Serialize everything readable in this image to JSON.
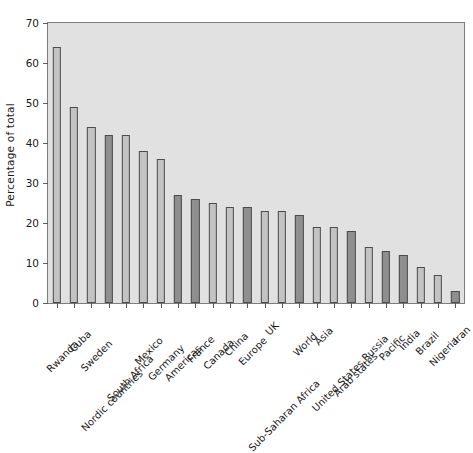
{
  "chart_data": {
    "type": "bar",
    "title": "",
    "xlabel": "",
    "ylabel": "Percentage of total",
    "ylim": [
      0,
      70
    ],
    "yticks": [
      0,
      10,
      20,
      30,
      40,
      50,
      60,
      70
    ],
    "grid": false,
    "legend": "none",
    "categories": [
      "Rwanda",
      "Cuba",
      "Sweden",
      "Nordic countries",
      "South Africa",
      "Mexico",
      "Germany",
      "Americas",
      "France",
      "Canada",
      "China",
      "Europe",
      "UK",
      "Sub-Saharan Africa",
      "World",
      "Asia",
      "United States",
      "Arab states",
      "Russia",
      "Pacific",
      "India",
      "Brazil",
      "Nigeria",
      "Iran"
    ],
    "values": [
      64,
      49,
      44,
      42,
      42,
      38,
      36,
      27,
      26,
      25,
      24,
      24,
      23,
      23,
      22,
      19,
      19,
      18,
      14,
      13,
      12,
      9,
      7,
      3
    ],
    "bar_shades": [
      "light",
      "light",
      "light",
      "dark",
      "light",
      "light",
      "light",
      "dark",
      "dark",
      "light",
      "light",
      "dark",
      "light",
      "light",
      "dark",
      "light",
      "light",
      "dark",
      "light",
      "dark",
      "dark",
      "light",
      "light",
      "dark"
    ],
    "colors": {
      "bar_light": "#c3c3c3",
      "bar_dark": "#8f8f8f",
      "bar_edge": "#4c4c4c",
      "plot_background": "#e1e1e1",
      "axis": "#5a5a5a",
      "text": "#1a1a1a",
      "figure_background": "#ffffff"
    }
  }
}
